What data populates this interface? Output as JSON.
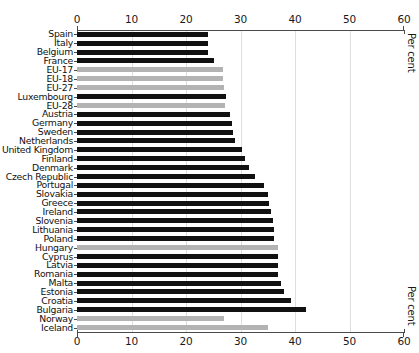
{
  "chart_data": {
    "type": "bar",
    "orientation": "horizontal",
    "title": "",
    "xlabel": "Per cent",
    "ylabel": "",
    "xlim": [
      0,
      60
    ],
    "xticks": [
      0,
      10,
      20,
      30,
      40,
      50,
      60
    ],
    "grid": true,
    "axis_top": true,
    "axis_bottom": true,
    "legend": null,
    "colors": {
      "country": "#111111",
      "aggregate": "#b3b3b3",
      "non_eu": "#b3b3b3",
      "grid": "#dedede",
      "axis": "#4a4a4a",
      "background": "#ffffff"
    },
    "categories": [
      "Spain",
      "Italy",
      "Belgium",
      "France",
      "EU-17",
      "EU-18",
      "EU-27",
      "Luxembourg",
      "EU-28",
      "Austria",
      "Germany",
      "Sweden",
      "Netherlands",
      "United Kingdom",
      "Finland",
      "Denmark",
      "Czech Republic",
      "Portugal",
      "Slovakia",
      "Greece",
      "Ireland",
      "Slovenia",
      "Lithuania",
      "Poland",
      "Hungary",
      "Cyprus",
      "Latvia",
      "Romania",
      "Malta",
      "Estonia",
      "Croatia",
      "Bulgaria",
      "Norway",
      "Iceland"
    ],
    "values": [
      24.0,
      24.0,
      24.0,
      25.2,
      26.8,
      26.8,
      27.0,
      27.4,
      27.2,
      28.0,
      28.4,
      28.6,
      29.0,
      30.2,
      30.8,
      31.6,
      32.6,
      34.4,
      35.0,
      35.2,
      35.6,
      36.0,
      36.2,
      36.2,
      36.8,
      36.8,
      36.8,
      36.8,
      37.4,
      38.0,
      39.2,
      42.0,
      27.0,
      35.0
    ],
    "series_group": [
      "country",
      "country",
      "country",
      "country",
      "aggregate",
      "aggregate",
      "aggregate",
      "country",
      "aggregate",
      "country",
      "country",
      "country",
      "country",
      "country",
      "country",
      "country",
      "country",
      "country",
      "country",
      "country",
      "country",
      "country",
      "country",
      "country",
      "aggregate",
      "country",
      "country",
      "country",
      "country",
      "country",
      "country",
      "country",
      "non_eu",
      "non_eu"
    ]
  }
}
